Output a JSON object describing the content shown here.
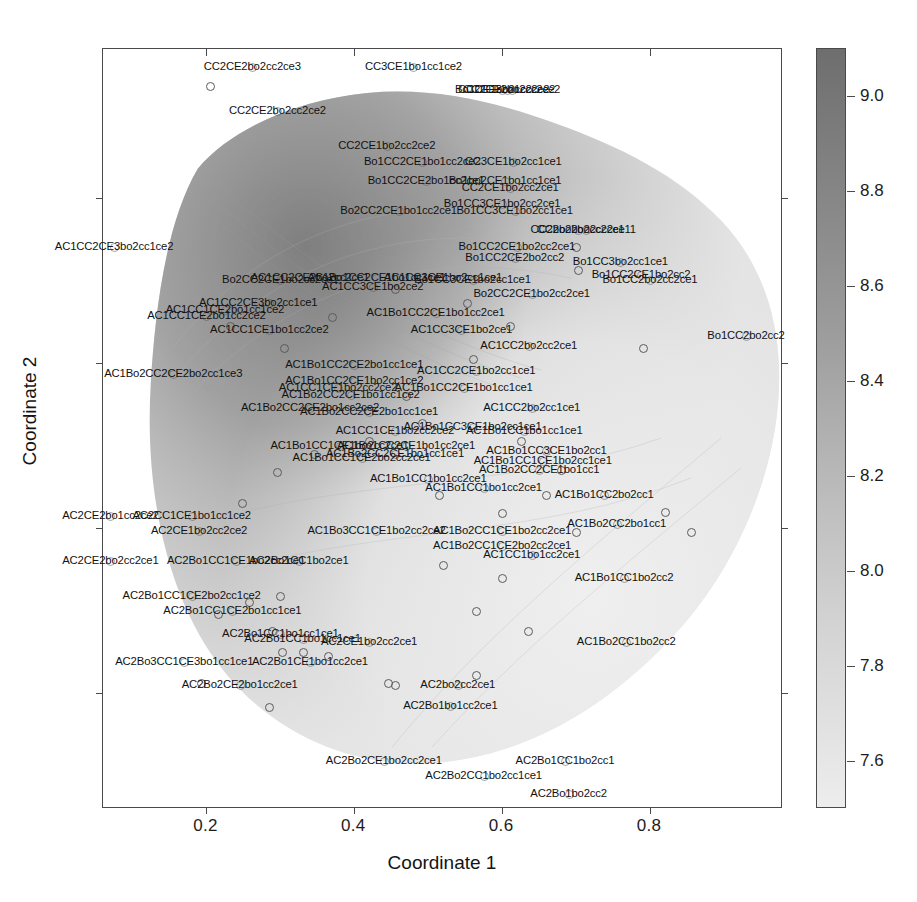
{
  "chart_data": {
    "type": "scatter",
    "title": "",
    "xlabel": "Coordinate 1",
    "ylabel": "Coordinate 2",
    "xlim": [
      0.06,
      0.98
    ],
    "ylim": [
      0.06,
      0.98
    ],
    "xticks": [
      0.2,
      0.4,
      0.6,
      0.8
    ],
    "xticklabels": [
      "0.2",
      "0.4",
      "0.6",
      "0.8"
    ],
    "yticks": [
      0.2,
      0.4,
      0.6,
      0.8
    ],
    "yticklabels": [
      "0.2",
      "0.4",
      "0.6",
      "0.8"
    ],
    "grid": false,
    "legend": "none",
    "colorbar": {
      "ticks": [
        9.0,
        8.8,
        8.6,
        8.4,
        8.2,
        8.0,
        7.8,
        7.6
      ],
      "ticklabels": [
        "9.0",
        "8.8",
        "8.6",
        "8.4",
        "8.2",
        "8.0",
        "7.8",
        "7.6"
      ],
      "vmin": 7.5,
      "vmax": 9.1,
      "orientation": "vertical",
      "colormap": "grayscale-dark-high",
      "dark_color": "#6e6e6e",
      "light_color": "#ededed"
    },
    "surface": {
      "kind": "filled-contour-density",
      "description": "irregular grayscale density blob, darker toward upper-left, lighter toward lower-right"
    },
    "points": [
      {
        "label": "CC2CE2bo2cc2ce3",
        "x": 0.262,
        "y": 0.958,
        "lx": 0.262,
        "ly": 0.958
      },
      {
        "label": "CC3CE1bo1cc1ce2",
        "x": 0.48,
        "y": 0.958,
        "lx": 0.48,
        "ly": 0.958
      },
      {
        "label": "Bo1CE1bo2cc2ce2",
        "x": 0.6,
        "y": 0.93,
        "lx": 0.6,
        "ly": 0.93
      },
      {
        "label": "CC2CE2bo2cc2ce2",
        "x": 0.613,
        "y": 0.93,
        "lx": 0.613,
        "ly": 0.93
      },
      {
        "label": "CC2CE3bo1cc2ce2",
        "x": 0.606,
        "y": 0.93,
        "lx": 0.606,
        "ly": 0.93
      },
      {
        "label": "CC2CE2bo2cc2ce2",
        "x": 0.296,
        "y": 0.905,
        "lx": 0.296,
        "ly": 0.905
      },
      {
        "label": "CC2CE1bo2cc2ce2",
        "x": 0.444,
        "y": 0.862,
        "lx": 0.444,
        "ly": 0.862
      },
      {
        "label": "Bo1CC2CE1bo1cc2ce2",
        "x": 0.492,
        "y": 0.843,
        "lx": 0.492,
        "ly": 0.843
      },
      {
        "label": "CC3CE1bo2cc1ce1",
        "x": 0.615,
        "y": 0.843,
        "lx": 0.615,
        "ly": 0.843
      },
      {
        "label": "Bo1CC2CE2bo1cc2ce1",
        "x": 0.497,
        "y": 0.82,
        "lx": 0.497,
        "ly": 0.82
      },
      {
        "label": "Bo1bo2CE1bo1cc1ce1",
        "x": 0.604,
        "y": 0.82,
        "lx": 0.604,
        "ly": 0.82
      },
      {
        "label": "CC2CE1bo2cc2ce1",
        "x": 0.611,
        "y": 0.812,
        "lx": 0.611,
        "ly": 0.812
      },
      {
        "label": "Bo1CC3CE1bo2cc2ce1",
        "x": 0.6,
        "y": 0.792,
        "lx": 0.6,
        "ly": 0.792
      },
      {
        "label": "Bo2CC2CE1bo1cc2ce1",
        "x": 0.46,
        "y": 0.784,
        "lx": 0.46,
        "ly": 0.784
      },
      {
        "label": "Bo1CC3CE1bo2cc1ce1",
        "x": 0.617,
        "y": 0.784,
        "lx": 0.617,
        "ly": 0.784
      },
      {
        "label": "CC2bo2bo2cc2ce1",
        "x": 0.702,
        "y": 0.761,
        "lx": 0.702,
        "ly": 0.761
      },
      {
        "label": "CC2bo2bo2cc2ce11",
        "x": 0.714,
        "y": 0.761,
        "lx": 0.714,
        "ly": 0.761
      },
      {
        "label": "Bo1CC2CE1bo2cc2ce1",
        "x": 0.62,
        "y": 0.74,
        "lx": 0.62,
        "ly": 0.74
      },
      {
        "label": "Bo1CC2CE2bo2cc2",
        "x": 0.617,
        "y": 0.727,
        "lx": 0.617,
        "ly": 0.727
      },
      {
        "label": "Bo1CC3bo2cc1ce1",
        "x": 0.76,
        "y": 0.722,
        "lx": 0.76,
        "ly": 0.722
      },
      {
        "label": "AC1CC2CE3bo2cc1ce2",
        "x": 0.075,
        "y": 0.74,
        "lx": 0.075,
        "ly": 0.74
      },
      {
        "label": "Bo2CC2CE1bo2cc2ce1",
        "x": 0.3,
        "y": 0.7,
        "lx": 0.3,
        "ly": 0.7
      },
      {
        "label": "Bo1CC3CE1bo2cc1ce1",
        "x": 0.56,
        "y": 0.7,
        "lx": 0.56,
        "ly": 0.7
      },
      {
        "label": "Bo1CC2CE1bo2cc2",
        "x": 0.788,
        "y": 0.706,
        "lx": 0.788,
        "ly": 0.706
      },
      {
        "label": "Bo1CC2bo2cc2ce1",
        "x": 0.8,
        "y": 0.7,
        "lx": 0.8,
        "ly": 0.7
      },
      {
        "label": "Bo2CC2CE1bo2cc2ce1",
        "x": 0.64,
        "y": 0.684,
        "lx": 0.64,
        "ly": 0.684
      },
      {
        "label": "AC1CC2CE2bo2cc2ce1",
        "x": 0.34,
        "y": 0.703,
        "lx": 0.34,
        "ly": 0.703
      },
      {
        "label": "AC1Bo1CC2CE1bo1cc1ce1",
        "x": 0.43,
        "y": 0.703,
        "lx": 0.43,
        "ly": 0.703
      },
      {
        "label": "AC1CC3CE1bo2cc1ce1",
        "x": 0.52,
        "y": 0.703,
        "lx": 0.52,
        "ly": 0.703
      },
      {
        "label": "AC1CC3CE1bo2ce2",
        "x": 0.425,
        "y": 0.692,
        "lx": 0.425,
        "ly": 0.692
      },
      {
        "label": "AC1CC2CE3bo2cc1ce1",
        "x": 0.27,
        "y": 0.672,
        "lx": 0.27,
        "ly": 0.672
      },
      {
        "label": "AC1CC1CE2bo1cc1ce2",
        "x": 0.225,
        "y": 0.664,
        "lx": 0.225,
        "ly": 0.664
      },
      {
        "label": "AC1CC1CE2bo1cc2ce2",
        "x": 0.2,
        "y": 0.657,
        "lx": 0.2,
        "ly": 0.657
      },
      {
        "label": "AC1Bo1CC2CE1bo1cc2ce1",
        "x": 0.51,
        "y": 0.66,
        "lx": 0.51,
        "ly": 0.66
      },
      {
        "label": "AC1CC1CE1bo1cc2ce2",
        "x": 0.285,
        "y": 0.64,
        "lx": 0.285,
        "ly": 0.64
      },
      {
        "label": "AC1CC3CE1bo2ce1",
        "x": 0.545,
        "y": 0.64,
        "lx": 0.545,
        "ly": 0.64
      },
      {
        "label": "Bo1CC2bo2cc2",
        "x": 0.93,
        "y": 0.632,
        "lx": 0.93,
        "ly": 0.632
      },
      {
        "label": "AC1CC2bo2cc2ce1",
        "x": 0.636,
        "y": 0.62,
        "lx": 0.636,
        "ly": 0.62
      },
      {
        "label": "AC1Bo1CC2CE2bo1cc1ce1",
        "x": 0.4,
        "y": 0.598,
        "lx": 0.4,
        "ly": 0.598
      },
      {
        "label": "AC1Bo2CC2CE2bo2cc1ce3",
        "x": 0.155,
        "y": 0.587,
        "lx": 0.155,
        "ly": 0.587
      },
      {
        "label": "AC1CC2CE1bo2cc1ce1",
        "x": 0.565,
        "y": 0.59,
        "lx": 0.565,
        "ly": 0.59
      },
      {
        "label": "AC1Bo1CC2CE1bo2cc1ce2",
        "x": 0.4,
        "y": 0.578,
        "lx": 0.4,
        "ly": 0.578
      },
      {
        "label": "AC1CC1CE1bo2cc2ce2",
        "x": 0.378,
        "y": 0.57,
        "lx": 0.378,
        "ly": 0.57
      },
      {
        "label": "AC1Bo1CC2CE1bo1cc1ce1",
        "x": 0.548,
        "y": 0.57,
        "lx": 0.548,
        "ly": 0.57
      },
      {
        "label": "AC1Bo2CC2CE1bo1cc1ce2",
        "x": 0.395,
        "y": 0.561,
        "lx": 0.395,
        "ly": 0.561
      },
      {
        "label": "AC1Bo2CC2CE2bo1cc2ce2",
        "x": 0.34,
        "y": 0.545,
        "lx": 0.34,
        "ly": 0.545
      },
      {
        "label": "AC1Bo2CC2CE2bo1cc1ce1",
        "x": 0.42,
        "y": 0.54,
        "lx": 0.42,
        "ly": 0.54
      },
      {
        "label": "AC1CC2bo2cc1ce1",
        "x": 0.64,
        "y": 0.545,
        "lx": 0.64,
        "ly": 0.545
      },
      {
        "label": "AC1Bo1CC3CE1bo2cc1ce1",
        "x": 0.56,
        "y": 0.523,
        "lx": 0.56,
        "ly": 0.523
      },
      {
        "label": "AC1CC1CE1bo2cc2ce2",
        "x": 0.455,
        "y": 0.517,
        "lx": 0.455,
        "ly": 0.517
      },
      {
        "label": "AC1Bo1CC1bo1cc1ce1",
        "x": 0.63,
        "y": 0.517,
        "lx": 0.63,
        "ly": 0.517
      },
      {
        "label": "AC1Bo1CC1CE1bo2cc2ce1",
        "x": 0.38,
        "y": 0.5,
        "lx": 0.38,
        "ly": 0.5
      },
      {
        "label": "AC1Bo1CC2CE1bo1cc2ce1",
        "x": 0.47,
        "y": 0.5,
        "lx": 0.47,
        "ly": 0.5
      },
      {
        "label": "AC1Bo2CC2CE1bo1cc1ce1",
        "x": 0.455,
        "y": 0.49,
        "lx": 0.455,
        "ly": 0.49
      },
      {
        "label": "AC1Bo1CC1CE2bo2cc2ce1",
        "x": 0.41,
        "y": 0.485,
        "lx": 0.41,
        "ly": 0.485
      },
      {
        "label": "AC1Bo1CC3CE1bo2cc1",
        "x": 0.66,
        "y": 0.493,
        "lx": 0.66,
        "ly": 0.493
      },
      {
        "label": "AC1Bo1CC1CE1bo2cc1ce1",
        "x": 0.655,
        "y": 0.481,
        "lx": 0.655,
        "ly": 0.481
      },
      {
        "label": "AC1Bo2CC2CE1bo1cc1",
        "x": 0.65,
        "y": 0.47,
        "lx": 0.65,
        "ly": 0.47
      },
      {
        "label": "AC1Bo1CC1bo1cc2ce1",
        "x": 0.5,
        "y": 0.46,
        "lx": 0.5,
        "ly": 0.46
      },
      {
        "label": "AC1Bo1CC1bo1cc2ce1",
        "x": 0.575,
        "y": 0.448,
        "lx": 0.575,
        "ly": 0.448
      },
      {
        "label": "AC1Bo1CC2bo2cc1",
        "x": 0.738,
        "y": 0.44,
        "lx": 0.738,
        "ly": 0.44
      },
      {
        "label": "AC2CE2bo1cc2ce2",
        "x": 0.07,
        "y": 0.415,
        "lx": 0.07,
        "ly": 0.415
      },
      {
        "label": "AC2CC1CE1bo1cc1ce2",
        "x": 0.18,
        "y": 0.415,
        "lx": 0.18,
        "ly": 0.415
      },
      {
        "label": "AC2CE1bo2cc2ce2",
        "x": 0.19,
        "y": 0.396,
        "lx": 0.19,
        "ly": 0.396
      },
      {
        "label": "AC1Bo3CC1CE1bo2cc2ce2",
        "x": 0.43,
        "y": 0.396,
        "lx": 0.43,
        "ly": 0.396
      },
      {
        "label": "AC1Bo2CC1CE1bo2cc2ce1",
        "x": 0.6,
        "y": 0.396,
        "lx": 0.6,
        "ly": 0.396
      },
      {
        "label": "AC1Bo2CC2bo1cc1",
        "x": 0.755,
        "y": 0.405,
        "lx": 0.755,
        "ly": 0.405
      },
      {
        "label": "AC1Bo2CC1CE2bo2cc2ce1",
        "x": 0.6,
        "y": 0.378,
        "lx": 0.6,
        "ly": 0.378
      },
      {
        "label": "AC2CE2bo2cc2ce1",
        "x": 0.07,
        "y": 0.36,
        "lx": 0.07,
        "ly": 0.36
      },
      {
        "label": "AC2Bo1CC1CE1bo2cc2ce1",
        "x": 0.24,
        "y": 0.36,
        "lx": 0.24,
        "ly": 0.36
      },
      {
        "label": "AC2Bo1CC1bo2ce1",
        "x": 0.325,
        "y": 0.36,
        "lx": 0.325,
        "ly": 0.36
      },
      {
        "label": "AC1CC1bo1cc2ce1",
        "x": 0.64,
        "y": 0.368,
        "lx": 0.64,
        "ly": 0.368
      },
      {
        "label": "AC1Bo1CC1bo2cc2",
        "x": 0.765,
        "y": 0.34,
        "lx": 0.765,
        "ly": 0.34
      },
      {
        "label": "AC2Bo1CC1CE2bo2cc1ce2",
        "x": 0.18,
        "y": 0.318,
        "lx": 0.18,
        "ly": 0.318
      },
      {
        "label": "AC2Bo1CC1CE2bo1cc1ce1",
        "x": 0.235,
        "y": 0.3,
        "lx": 0.235,
        "ly": 0.3
      },
      {
        "label": "AC2Bo1CC1bo1cc1ce1",
        "x": 0.3,
        "y": 0.272,
        "lx": 0.3,
        "ly": 0.272
      },
      {
        "label": "AC2Bo1CC1bo1cc1ce1",
        "x": 0.33,
        "y": 0.266,
        "lx": 0.33,
        "ly": 0.266
      },
      {
        "label": "AC2CE1bo2cc2ce1",
        "x": 0.42,
        "y": 0.262,
        "lx": 0.42,
        "ly": 0.262
      },
      {
        "label": "AC1Bo2CC1bo2cc2",
        "x": 0.768,
        "y": 0.262,
        "lx": 0.768,
        "ly": 0.262
      },
      {
        "label": "AC2Bo3CC1CE3bo1cc1ce1",
        "x": 0.17,
        "y": 0.238,
        "lx": 0.17,
        "ly": 0.238
      },
      {
        "label": "AC2Bo1CE1bo1cc2ce1",
        "x": 0.34,
        "y": 0.238,
        "lx": 0.34,
        "ly": 0.238
      },
      {
        "label": "AC2Bo2CE2bo1cc2ce1",
        "x": 0.245,
        "y": 0.21,
        "lx": 0.245,
        "ly": 0.21
      },
      {
        "label": "AC2bo2cc2ce1",
        "x": 0.54,
        "y": 0.21,
        "lx": 0.54,
        "ly": 0.21
      },
      {
        "label": "AC2Bo1bo1cc2ce1",
        "x": 0.53,
        "y": 0.185,
        "lx": 0.53,
        "ly": 0.185
      },
      {
        "label": "AC2Bo2CE1bo2cc2ce1",
        "x": 0.44,
        "y": 0.118,
        "lx": 0.44,
        "ly": 0.118
      },
      {
        "label": "AC2Bo1CC1bo2cc1",
        "x": 0.685,
        "y": 0.118,
        "lx": 0.685,
        "ly": 0.118
      },
      {
        "label": "AC2Bo2CC1bo2cc1ce1",
        "x": 0.575,
        "y": 0.1,
        "lx": 0.575,
        "ly": 0.1
      },
      {
        "label": "AC2Bo1bo2cc2",
        "x": 0.69,
        "y": 0.078,
        "lx": 0.69,
        "ly": 0.078
      }
    ],
    "markers": [
      {
        "x": 0.205,
        "y": 0.935
      },
      {
        "x": 0.285,
        "y": 0.672
      },
      {
        "x": 0.232,
        "y": 0.645
      },
      {
        "x": 0.305,
        "y": 0.618
      },
      {
        "x": 0.553,
        "y": 0.672
      },
      {
        "x": 0.61,
        "y": 0.645
      },
      {
        "x": 0.7,
        "y": 0.74
      },
      {
        "x": 0.703,
        "y": 0.713
      },
      {
        "x": 0.79,
        "y": 0.618
      },
      {
        "x": 0.56,
        "y": 0.605
      },
      {
        "x": 0.47,
        "y": 0.56
      },
      {
        "x": 0.492,
        "y": 0.527
      },
      {
        "x": 0.42,
        "y": 0.505
      },
      {
        "x": 0.345,
        "y": 0.49
      },
      {
        "x": 0.625,
        "y": 0.505
      },
      {
        "x": 0.68,
        "y": 0.47
      },
      {
        "x": 0.295,
        "y": 0.468
      },
      {
        "x": 0.248,
        "y": 0.43
      },
      {
        "x": 0.515,
        "y": 0.44
      },
      {
        "x": 0.66,
        "y": 0.44
      },
      {
        "x": 0.82,
        "y": 0.42
      },
      {
        "x": 0.258,
        "y": 0.31
      },
      {
        "x": 0.3,
        "y": 0.318
      },
      {
        "x": 0.215,
        "y": 0.296
      },
      {
        "x": 0.288,
        "y": 0.275
      },
      {
        "x": 0.565,
        "y": 0.3
      },
      {
        "x": 0.635,
        "y": 0.275
      },
      {
        "x": 0.302,
        "y": 0.25
      },
      {
        "x": 0.33,
        "y": 0.25
      },
      {
        "x": 0.365,
        "y": 0.245
      },
      {
        "x": 0.192,
        "y": 0.212
      },
      {
        "x": 0.445,
        "y": 0.212
      },
      {
        "x": 0.455,
        "y": 0.21
      },
      {
        "x": 0.285,
        "y": 0.183
      },
      {
        "x": 0.565,
        "y": 0.222
      },
      {
        "x": 0.6,
        "y": 0.418
      },
      {
        "x": 0.7,
        "y": 0.395
      },
      {
        "x": 0.855,
        "y": 0.395
      },
      {
        "x": 0.52,
        "y": 0.355
      },
      {
        "x": 0.6,
        "y": 0.34
      },
      {
        "x": 0.455,
        "y": 0.69
      },
      {
        "x": 0.37,
        "y": 0.655
      }
    ]
  }
}
